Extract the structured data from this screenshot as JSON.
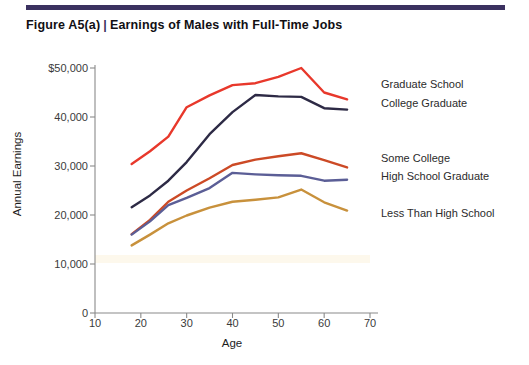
{
  "figure": {
    "number": "Figure A5(a)",
    "divider": "|",
    "title": "Earnings of Males with Full-Time Jobs"
  },
  "colors": {
    "rule": "#3b3160",
    "graduate_school": "#E8382B",
    "college_graduate": "#2D2A45",
    "some_college": "#CC4A26",
    "high_school_graduate": "#5B5E96",
    "less_than_high_school": "#C8913C",
    "axis": "#8a8a8a",
    "text": "#2b2b2b",
    "band": "#fdf8ec"
  },
  "chart_data": {
    "type": "line",
    "title": "Earnings of Males with Full-Time Jobs",
    "xlabel": "Age",
    "ylabel": "Annual Earnings",
    "xlim": [
      10,
      70
    ],
    "ylim": [
      0,
      50000
    ],
    "xticks": [
      10,
      20,
      30,
      40,
      50,
      60,
      70
    ],
    "xtick_labels": [
      "10",
      "20",
      "30",
      "40",
      "50",
      "60",
      "70"
    ],
    "yticks": [
      0,
      10000,
      20000,
      30000,
      40000,
      50000
    ],
    "ytick_labels": [
      "0",
      "10,000",
      "20,000",
      "30,000",
      "40,000",
      "$50,000"
    ],
    "grid": false,
    "legend_position": "right-inline",
    "x": [
      18,
      22,
      26,
      30,
      35,
      40,
      45,
      50,
      55,
      60,
      65
    ],
    "series": [
      {
        "name": "Graduate School",
        "color": "#E8382B",
        "values": [
          30400,
          33000,
          36000,
          42000,
          44400,
          46500,
          46900,
          48200,
          50000,
          45000,
          43600
        ]
      },
      {
        "name": "College Graduate",
        "color": "#2D2A45",
        "values": [
          21600,
          24000,
          27000,
          30800,
          36500,
          41000,
          44500,
          44200,
          44100,
          41800,
          41500
        ]
      },
      {
        "name": "Some College",
        "color": "#CC4A26",
        "values": [
          16100,
          19000,
          22700,
          25000,
          27500,
          30200,
          31300,
          32000,
          32600,
          31200,
          29700
        ]
      },
      {
        "name": "High School Graduate",
        "color": "#5B5E96",
        "values": [
          16000,
          18700,
          22000,
          23500,
          25500,
          28600,
          28300,
          28100,
          28000,
          27000,
          27200
        ]
      },
      {
        "name": "Less Than High School",
        "color": "#C8913C",
        "values": [
          13800,
          16000,
          18300,
          19900,
          21500,
          22700,
          23100,
          23600,
          25200,
          22600,
          20900
        ]
      }
    ]
  },
  "series_labels": [
    {
      "text": "Graduate School",
      "color": "#2b2b2b"
    },
    {
      "text": "College Graduate",
      "color": "#2b2b2b"
    },
    {
      "text": "Some College",
      "color": "#2b2b2b"
    },
    {
      "text": "High School Graduate",
      "color": "#2b2b2b"
    },
    {
      "text": "Less Than High School",
      "color": "#2b2b2b"
    }
  ]
}
